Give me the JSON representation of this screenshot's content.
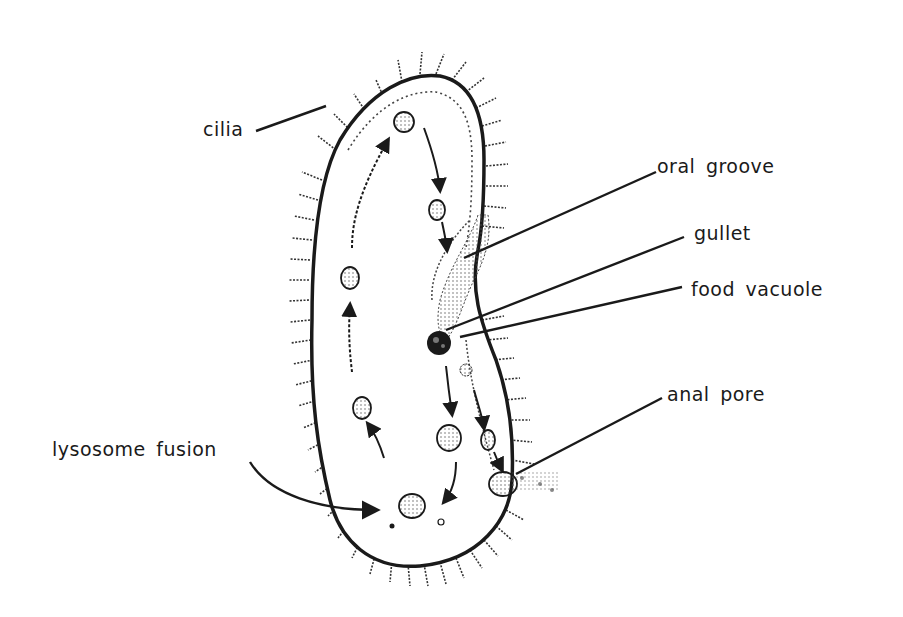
{
  "diagram": {
    "colors": {
      "ink": "#1a1a1a",
      "background": "#ffffff",
      "stipple": "#555555"
    },
    "labels": {
      "cilia": "cilia",
      "oral_groove": "oral groove",
      "gullet": "gullet",
      "food_vacuole": "food vacuole",
      "anal_pore": "anal pore",
      "lysosome_fusion": "lysosome fusion"
    }
  }
}
